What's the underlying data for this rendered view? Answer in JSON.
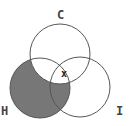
{
  "diagram": {
    "type": "venn",
    "sets": [
      {
        "id": "C",
        "label": "C",
        "cx": 60,
        "cy": 54,
        "r": 30,
        "label_x": 60,
        "label_y": 19
      },
      {
        "id": "H",
        "label": "H",
        "cx": 40,
        "cy": 88,
        "r": 30,
        "label_x": 5,
        "label_y": 114
      },
      {
        "id": "I",
        "label": "I",
        "cx": 80,
        "cy": 87,
        "r": 30,
        "label_x": 120,
        "label_y": 114
      }
    ],
    "shaded_region": "H minus C",
    "shade_color": "#777777",
    "marker": {
      "symbol": "x",
      "x": 65,
      "y": 73,
      "region": "C ∩ H ∩ I boundary"
    }
  }
}
